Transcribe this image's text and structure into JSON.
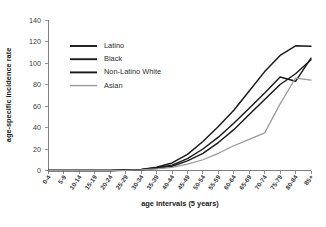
{
  "chart_data": {
    "type": "line",
    "title": "",
    "xlabel": "age intervals (5 years)",
    "ylabel": "age-specific incidence rate",
    "ylim": [
      0,
      140
    ],
    "yticks": [
      0,
      20,
      40,
      60,
      80,
      100,
      120,
      140
    ],
    "grid": false,
    "legend_position": "upper-left-inside",
    "categories": [
      "0-4",
      "5-9",
      "10-14",
      "15-19",
      "20-24",
      "25-29",
      "30-34",
      "35-39",
      "40-44",
      "45-49",
      "50-54",
      "55-59",
      "60-64",
      "65-69",
      "70-74",
      "75-79",
      "80-84",
      "85+"
    ],
    "series": [
      {
        "name": "Latino",
        "color": "#1a1a1a",
        "values": [
          0,
          0,
          0,
          0,
          0,
          0.5,
          1,
          3,
          7,
          15,
          27,
          41,
          56,
          74,
          92,
          107,
          116,
          115.5
        ]
      },
      {
        "name": "Black",
        "color": "#1a1a1a",
        "values": [
          0,
          0,
          0,
          0,
          0,
          0.4,
          0.8,
          2.5,
          5,
          11,
          20,
          31,
          44,
          58,
          72,
          87,
          83,
          104.5
        ]
      },
      {
        "name": "Non-Latino White",
        "color": "#1a1a1a",
        "values": [
          0,
          0,
          0,
          0,
          0,
          0.3,
          0.7,
          2,
          4,
          9,
          16,
          26,
          38,
          52,
          66,
          80,
          90,
          103
        ]
      },
      {
        "name": "Asian",
        "color": "#9a9a9a",
        "values": [
          0,
          0,
          0,
          0,
          0,
          0.2,
          0.5,
          1.5,
          3,
          6,
          10,
          16,
          23,
          29,
          35,
          62,
          86,
          84
        ]
      }
    ]
  },
  "legend": {
    "items": [
      {
        "label": "Latino"
      },
      {
        "label": "Black"
      },
      {
        "label": "Non-Latino White"
      },
      {
        "label": "Asian"
      }
    ]
  }
}
